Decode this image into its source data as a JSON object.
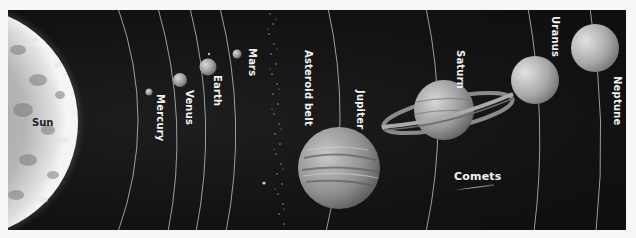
{
  "diagram": {
    "title": "",
    "style": "grayscale",
    "background": "#121212",
    "border": "#f7f7f7",
    "bodies": [
      {
        "name": "Sun",
        "label": "Sun",
        "type": "star"
      },
      {
        "name": "Mercury",
        "label": "Mercury",
        "type": "planet"
      },
      {
        "name": "Venus",
        "label": "Venus",
        "type": "planet"
      },
      {
        "name": "Earth",
        "label": "Earth",
        "type": "planet"
      },
      {
        "name": "Mars",
        "label": "Mars",
        "type": "planet"
      },
      {
        "name": "Asteroid belt",
        "label": "Asteroid belt",
        "type": "belt"
      },
      {
        "name": "Jupiter",
        "label": "Jupiter",
        "type": "planet"
      },
      {
        "name": "Saturn",
        "label": "Saturn",
        "type": "planet"
      },
      {
        "name": "Uranus",
        "label": "Uranus",
        "type": "planet"
      },
      {
        "name": "Neptune",
        "label": "Neptune",
        "type": "planet"
      },
      {
        "name": "Comets",
        "label": "Comets",
        "type": "comet"
      }
    ]
  }
}
